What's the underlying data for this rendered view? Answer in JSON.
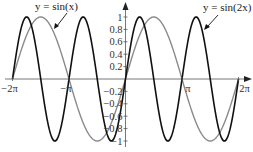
{
  "chart_data": {
    "type": "line",
    "title": "",
    "xlabel": "",
    "ylabel": "",
    "xlim": [
      -6.2832,
      6.2832
    ],
    "ylim": [
      -1,
      1
    ],
    "grid": false,
    "legend": "inline annotations with arrows",
    "x_ticks": [
      {
        "value": -6.2832,
        "label": "−2π"
      },
      {
        "value": -3.1416,
        "label": "−π"
      },
      {
        "value": 3.1416,
        "label": "π"
      },
      {
        "value": 6.2832,
        "label": "2π"
      }
    ],
    "y_ticks": [
      {
        "value": 1,
        "label": "1"
      },
      {
        "value": 0.8,
        "label": "0.8"
      },
      {
        "value": 0.6,
        "label": "0.6"
      },
      {
        "value": 0.4,
        "label": "0.4"
      },
      {
        "value": 0.2,
        "label": "0.2"
      },
      {
        "value": -0.2,
        "label": "−0.2"
      },
      {
        "value": -0.4,
        "label": "−0.4"
      },
      {
        "value": -0.6,
        "label": "−0.6"
      },
      {
        "value": -0.8,
        "label": "−0.8"
      },
      {
        "value": -1,
        "label": "−1"
      }
    ],
    "series": [
      {
        "name": "y = sin(x)",
        "function": "sin(x)",
        "color": "#8a8a8a",
        "x": [
          -6.2832,
          -4.7124,
          -3.1416,
          -1.5708,
          0,
          1.5708,
          3.1416,
          4.7124,
          6.2832
        ],
        "y": [
          0,
          1,
          0,
          -1,
          0,
          1,
          0,
          -1,
          0
        ]
      },
      {
        "name": "y = sin(2x)",
        "function": "sin(2x)",
        "color": "#111111",
        "x": [
          -6.2832,
          -5.4978,
          -4.7124,
          -3.927,
          -3.1416,
          -2.3562,
          -1.5708,
          -0.7854,
          0,
          0.7854,
          1.5708,
          2.3562,
          3.1416,
          3.927,
          4.7124,
          5.4978,
          6.2832
        ],
        "y": [
          0,
          1,
          0,
          -1,
          0,
          1,
          0,
          -1,
          0,
          1,
          0,
          -1,
          0,
          1,
          0,
          -1,
          0
        ]
      }
    ],
    "annotations": [
      {
        "text": "y =  sin(x)",
        "points_to": "sin(x) curve near x≈−4"
      },
      {
        "text": "y =  sin(2x)",
        "points_to": "sin(2x) curve near x≈4.2"
      }
    ]
  },
  "labels": {
    "anno_sinx": "y =  sin(x)",
    "anno_sin2x": "y =  sin(2x)"
  }
}
